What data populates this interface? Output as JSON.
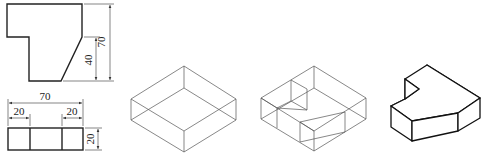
{
  "figure": {
    "front_view": {
      "dimensions": {
        "overall_height": "70",
        "right_height": "40"
      }
    },
    "top_view": {
      "dimensions": {
        "overall_width": "70",
        "left_width": "20",
        "right_width": "20",
        "depth": "20"
      }
    },
    "step1_label": "bounding box",
    "step2_label": "cut box",
    "step3_label": "finished solid",
    "caption": ""
  },
  "colors": {
    "line": "#222222",
    "wire": "#555555",
    "background": "#ffffff"
  }
}
